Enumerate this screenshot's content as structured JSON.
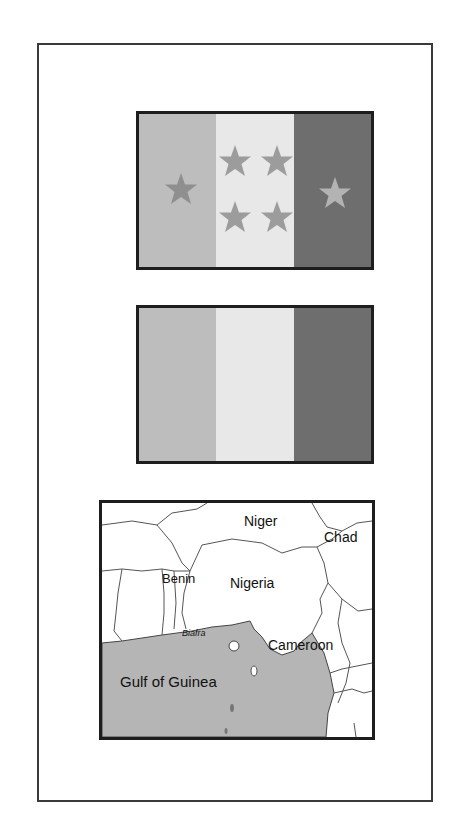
{
  "flags": [
    {
      "name": "flag-with-stars",
      "stripes": [
        "#bdbdbd",
        "#e8e8e8",
        "#6e6e6e"
      ],
      "stars": [
        {
          "stripe": 0,
          "x": 32,
          "y": 60,
          "color": "#8a8a8a"
        },
        {
          "stripe": 1,
          "x": 8,
          "y": 28,
          "color": "#9a9a9a"
        },
        {
          "stripe": 1,
          "x": 52,
          "y": 28,
          "color": "#9a9a9a"
        },
        {
          "stripe": 1,
          "x": 8,
          "y": 88,
          "color": "#9a9a9a"
        },
        {
          "stripe": 1,
          "x": 52,
          "y": 88,
          "color": "#9a9a9a"
        },
        {
          "stripe": 2,
          "x": 26,
          "y": 62,
          "color": "#b0b0b0"
        }
      ]
    },
    {
      "name": "flag-plain",
      "stripes": [
        "#bdbdbd",
        "#e8e8e8",
        "#6e6e6e"
      ]
    }
  ],
  "map": {
    "water_color": "#b5b5b5",
    "labels": {
      "niger": "Niger",
      "chad": "Chad",
      "benin": "Benin",
      "nigeria": "Nigeria",
      "biafra": "Biafra",
      "cameroon": "Cameroon",
      "gulf": "Gulf of Guinea"
    }
  }
}
